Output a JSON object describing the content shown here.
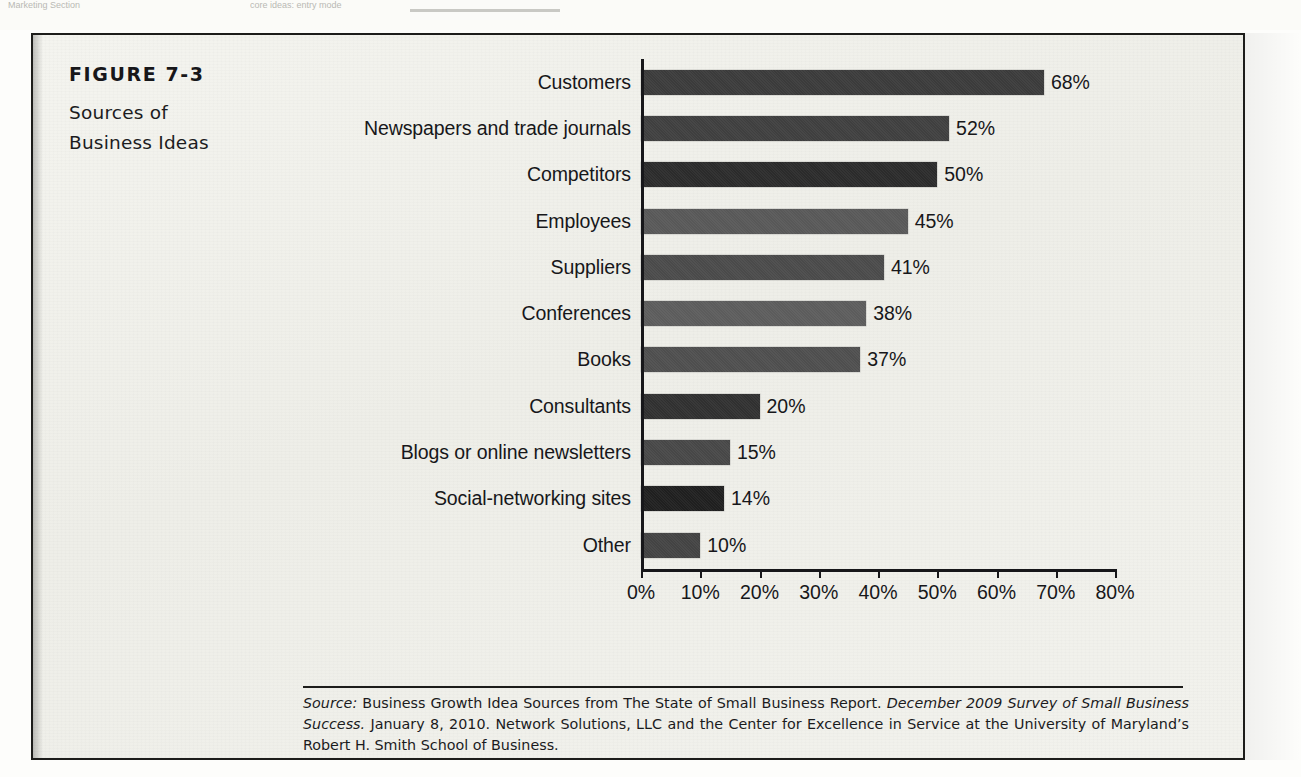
{
  "page": {
    "bleed_left": "Marketing Section",
    "bleed_mid": "core ideas: entry mode",
    "background_color": "#f1f1ec",
    "border_color": "#1d1d1b"
  },
  "figure": {
    "number": "FIGURE 7-3",
    "title_line1": "Sources of",
    "title_line2": "Business Ideas"
  },
  "source_note": {
    "label": "Source:",
    "text_part1": " Business Growth Idea Sources from The State of Small Business Report. ",
    "italic_part": "December 2009 Survey of Small Business Success.",
    "text_part2": " January 8, 2010. Network Solutions, LLC and the Center for Excellence in Service at the University of Maryland’s Robert H. Smith School of Business."
  },
  "chart_data": {
    "type": "bar",
    "orientation": "horizontal",
    "title": "Sources of Business Ideas",
    "xlabel": "",
    "ylabel": "",
    "xlim": [
      0,
      80
    ],
    "grid": false,
    "legend": "none",
    "value_suffix": "%",
    "xticks": [
      "0%",
      "10%",
      "20%",
      "30%",
      "40%",
      "50%",
      "60%",
      "70%",
      "80%"
    ],
    "xtick_values": [
      0,
      10,
      20,
      30,
      40,
      50,
      60,
      70,
      80
    ],
    "categories": [
      "Customers",
      "Newspapers and trade journals",
      "Competitors",
      "Employees",
      "Suppliers",
      "Conferences",
      "Books",
      "Consultants",
      "Blogs or online newsletters",
      "Social-networking sites",
      "Other"
    ],
    "values": [
      68,
      52,
      50,
      45,
      41,
      38,
      37,
      20,
      15,
      14,
      10
    ],
    "value_labels": [
      "68%",
      "52%",
      "50%",
      "45%",
      "41%",
      "38%",
      "37%",
      "20%",
      "15%",
      "14%",
      "10%"
    ],
    "bar_colors": [
      "#3b3b3b",
      "#3f3f3f",
      "#2b2b2b",
      "#585858",
      "#4a4a4a",
      "#5c5c5c",
      "#4e4e4e",
      "#303030",
      "#474747",
      "#1f1f1f",
      "#434343"
    ]
  }
}
